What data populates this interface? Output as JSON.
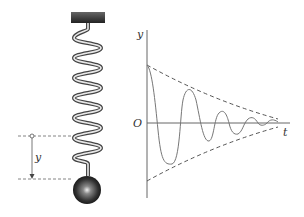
{
  "diagram": {
    "left_panel": {
      "description": "Mass hanging from a spring attached to a ceiling block, with displacement y marked",
      "displacement_label": "y"
    },
    "right_panel": {
      "y_axis_label": "y",
      "x_axis_label": "t",
      "origin_label": "O",
      "curve": "damped sinusoid",
      "envelope": "dashed decaying envelope lines"
    },
    "colors": {
      "line": "#555555",
      "curve": "#777777",
      "ceiling": "#3a3a3a",
      "ball": "#222222"
    }
  }
}
